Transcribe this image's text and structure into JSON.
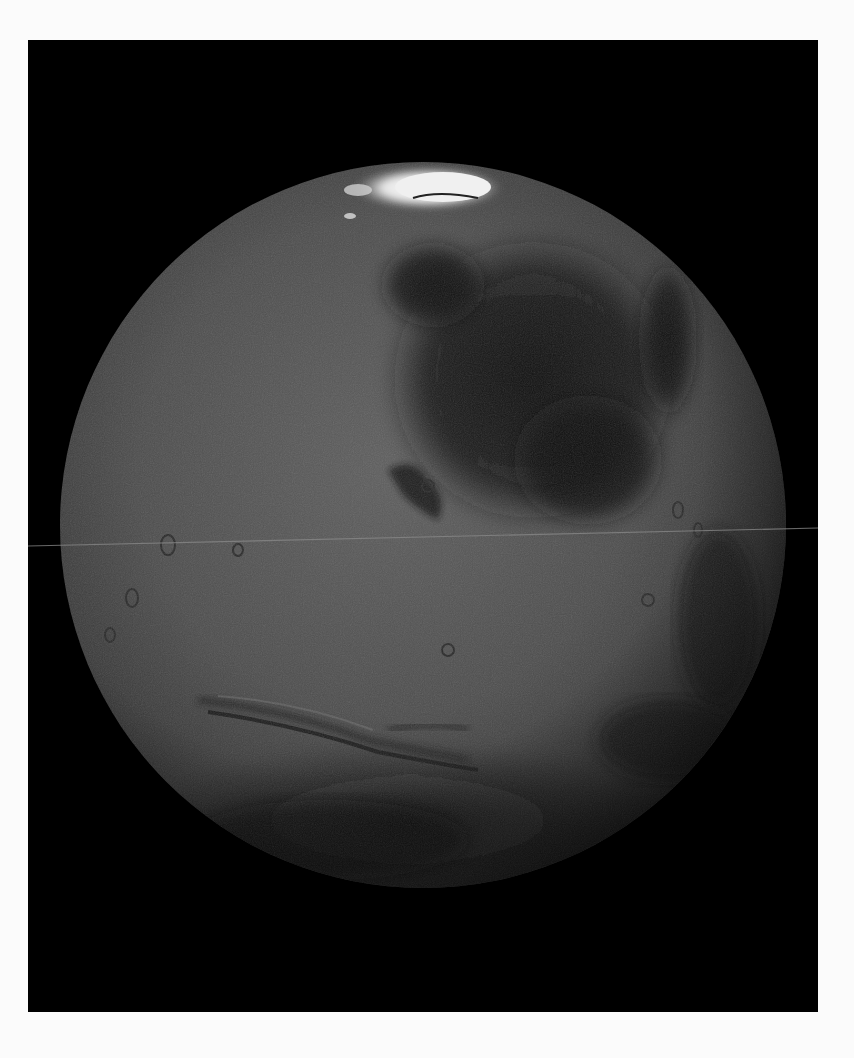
{
  "image": {
    "subject": "Mars full-disk view",
    "style": "grayscale photograph",
    "colors": {
      "page_background": "#fbfbfb",
      "space_background": "#000000",
      "surface_mid": "#4a4a4a",
      "surface_light": "#5c5c5c",
      "dark_albedo": "#141414",
      "polar_cap": "#f2f2f2",
      "scan_line": "#8a8a8a"
    },
    "features": [
      {
        "name": "north-polar-cap",
        "position": "top center"
      },
      {
        "name": "dark-albedo-region",
        "position": "upper right"
      },
      {
        "name": "valles-marineris-canyon",
        "position": "lower left center"
      },
      {
        "name": "southern-dark-highlands",
        "position": "bottom"
      },
      {
        "name": "horizontal-scan-line-artifact",
        "position": "across middle"
      }
    ]
  }
}
